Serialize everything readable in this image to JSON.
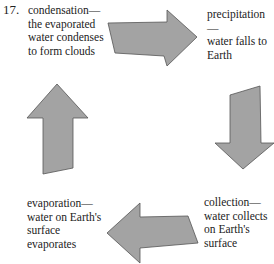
{
  "question_number": "17.",
  "stages": {
    "condensation": "condensation—\nthe evaporated\nwater condenses\nto form clouds",
    "precipitation": "precipitation—\nwater falls to\nEarth",
    "collection": "collection—\nwater collects\non Earth's\nsurface",
    "evaporation": "evaporation—\nwater on Earth's\nsurface\nevaporates"
  },
  "arrows": {
    "fill": "#a3a3a3",
    "stroke": "#555555",
    "order": [
      "condensation-to-precipitation (right)",
      "precipitation-to-collection (down)",
      "collection-to-evaporation (left)",
      "evaporation-to-condensation (up)"
    ]
  }
}
